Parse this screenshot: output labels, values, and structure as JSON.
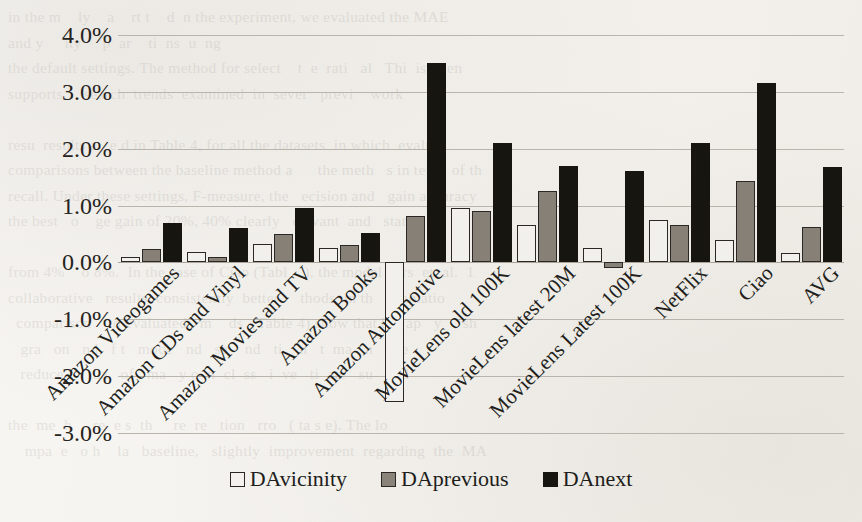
{
  "page": {
    "background_color": "#f3f1ec",
    "bleed_text": "in the m    ly    a    rt t    d  n the experiment, we evaluated the MAE\nand y     ity     p  ar    ti  ns  u  ng\nthe default settings. The method for select    t  e  rati   al   Thi  is  men\nsupports     search  trends  examined  in  sever   previ    work\n\nresu  results a   e d in Table 4, for all the datasets  in which  evalu\ncomparisons between the baseline method a      the meth   s in term  of th\nrecall. Under these settings, F-measure, the   ecision and   gain accuracy\nthe best   o    ge gain of 20%, 40% clearly   elevant  and   statisti\n\nfrom 4%    o 8%.  In the case of Ciao (Tabl    ), the model   ers  et  al.  1\ncollaborative   results  consistently  better     thods  in th   evaluatio\n  comparison    to evaluated   m    ds  (Table 4) show that b    ap   y     sh\n   gra   on   nd   f t   mode   nd   se    nd   ti    n   t  ma   n   nve\n   reduce       ua   of   ma   y o  n  cl  ss   i  ve   ti  ate   su   and\n\nthe  me  h     re  e s  th     re  re   tion   rro   ( ta s e). The lo\n    mpa  e   o h    la   baseline,   slightly  improvement  regarding  the  MA"
  },
  "chart_data": {
    "type": "bar",
    "title": "",
    "subtitle": "",
    "xlabel": "",
    "ylabel": "",
    "ylim": [
      -3.0,
      4.0
    ],
    "ytick_step": 1.0,
    "ytick_labels": [
      "4.0%",
      "3.0%",
      "2.0%",
      "1.0%",
      "0.0%",
      "-1.0%",
      "-2.0%",
      "-3.0%"
    ],
    "ytick_values": [
      4.0,
      3.0,
      2.0,
      1.0,
      0.0,
      -1.0,
      -2.0,
      -3.0
    ],
    "grid": true,
    "grid_axis": "y",
    "legend_position": "bottom",
    "value_unit": "%",
    "categories": [
      "Amazon Videogames",
      "Amazon CDs and Vinyl",
      "Amazon Movies and TV",
      "Amazon Books",
      "Amazon Automotive",
      "MovieLens old 100K",
      "MovieLens latest 20M",
      "MovieLens Latest 100K",
      "NetFlix",
      "Ciao",
      "AVG"
    ],
    "series": [
      {
        "name": "DAvicinity",
        "color": "#f2f0ec",
        "edge_color": "#2b2724",
        "values": [
          0.1,
          0.18,
          0.33,
          0.25,
          -2.45,
          0.95,
          0.65,
          0.25,
          0.75,
          0.4,
          0.17
        ]
      },
      {
        "name": "DAprevious",
        "color": "#878076",
        "edge_color": "#2b2724",
        "values": [
          0.23,
          0.1,
          0.5,
          0.3,
          0.82,
          0.9,
          1.25,
          -0.1,
          0.65,
          1.43,
          0.62
        ]
      },
      {
        "name": "DAnext",
        "color": "#17150f",
        "edge_color": "#17150f",
        "values": [
          0.7,
          0.6,
          0.95,
          0.52,
          3.5,
          2.1,
          1.7,
          1.6,
          2.1,
          3.15,
          1.67
        ]
      }
    ]
  },
  "legend": {
    "entries": [
      {
        "label": "DAvicinity",
        "swatch": "white-square-swatch"
      },
      {
        "label": "DAprevious",
        "swatch": "gray-square-swatch"
      },
      {
        "label": "DAnext",
        "swatch": "black-square-swatch"
      }
    ]
  }
}
